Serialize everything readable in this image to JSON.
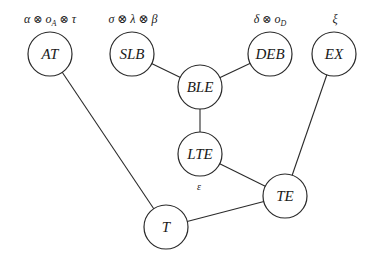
{
  "diagram": {
    "type": "graph",
    "nodes": [
      {
        "id": "AT",
        "label": "AT",
        "x": 50,
        "y": 54,
        "r": 22
      },
      {
        "id": "SLB",
        "label": "SLB",
        "x": 132,
        "y": 54,
        "r": 22
      },
      {
        "id": "DEB",
        "label": "DEB",
        "x": 270,
        "y": 54,
        "r": 22
      },
      {
        "id": "EX",
        "label": "EX",
        "x": 334,
        "y": 54,
        "r": 22
      },
      {
        "id": "BLE",
        "label": "BLE",
        "x": 200,
        "y": 87,
        "r": 22
      },
      {
        "id": "LTE",
        "label": "LTE",
        "x": 200,
        "y": 154,
        "r": 22
      },
      {
        "id": "TE",
        "label": "TE",
        "x": 285,
        "y": 196,
        "r": 22
      },
      {
        "id": "T",
        "label": "T",
        "x": 166,
        "y": 227,
        "r": 22
      }
    ],
    "edges": [
      {
        "from": "SLB",
        "to": "BLE"
      },
      {
        "from": "DEB",
        "to": "BLE"
      },
      {
        "from": "BLE",
        "to": "LTE"
      },
      {
        "from": "LTE",
        "to": "TE"
      },
      {
        "from": "EX",
        "to": "TE"
      },
      {
        "from": "TE",
        "to": "T"
      },
      {
        "from": "AT",
        "to": "T"
      }
    ],
    "annotations": {
      "AT": {
        "parts": [
          "α",
          "⊗",
          "o",
          "A",
          "⊗",
          "τ"
        ],
        "text": "α ⊗ o_A ⊗ τ"
      },
      "SLB": {
        "text": "σ ⊗ λ ⊗ β"
      },
      "DEB": {
        "parts": [
          "δ",
          "⊗",
          "o",
          "D"
        ],
        "text": "δ ⊗ o_D"
      },
      "EX": {
        "text": "ξ"
      },
      "LTE": {
        "text": "ε"
      }
    }
  }
}
